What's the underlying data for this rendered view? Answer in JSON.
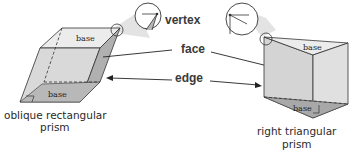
{
  "labels": {
    "vertex": "vertex",
    "face": "face",
    "edge": "edge"
  },
  "left_prism": {
    "top_base": "base",
    "bottom_base": "base",
    "caption_line1": "oblique rectangular",
    "caption_line2": "prism"
  },
  "right_prism": {
    "top_base": "base",
    "bottom_base": "base",
    "caption_line1": "right triangular",
    "caption_line2": "prism"
  },
  "colors": {
    "face_light": "#d9d9d9",
    "face_mid": "#c4c4c4",
    "face_dark": "#a9a9a9",
    "base_top": "#ececec",
    "stroke": "#333333",
    "callout": "#e6e6e6"
  }
}
